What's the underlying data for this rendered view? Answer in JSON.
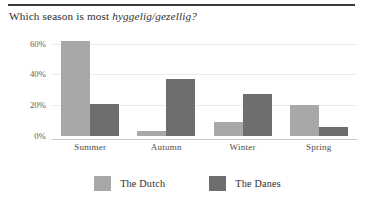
{
  "figure": {
    "title_prefix": "Which season is most ",
    "title_emphasis": "hyggelig/gezellig?",
    "accent_rule_color": "#3a3a3a"
  },
  "colors": {
    "dutch": "#a8a8a8",
    "danes": "#6e6e6e",
    "gridline": "#ebebeb",
    "baseline": "#c9c9c9",
    "text": "#2e2e2e"
  },
  "chart_data": {
    "type": "bar",
    "title": "Which season is most hyggelig/gezellig?",
    "xlabel": "",
    "ylabel": "",
    "ylim": [
      0,
      65
    ],
    "grid": true,
    "legend_position": "bottom-center",
    "tick_labels": [
      "0%",
      "20%",
      "40%",
      "60%"
    ],
    "tick_values": [
      0,
      20,
      40,
      60
    ],
    "categories": [
      "Summer",
      "Autumn",
      "Winter",
      "Spring"
    ],
    "series": [
      {
        "name": "The Dutch",
        "color": "#a8a8a8",
        "values": [
          62,
          3,
          9,
          20
        ]
      },
      {
        "name": "The Danes",
        "color": "#6e6e6e",
        "values": [
          21,
          37,
          27,
          6
        ]
      }
    ],
    "value_suffix": "%"
  }
}
